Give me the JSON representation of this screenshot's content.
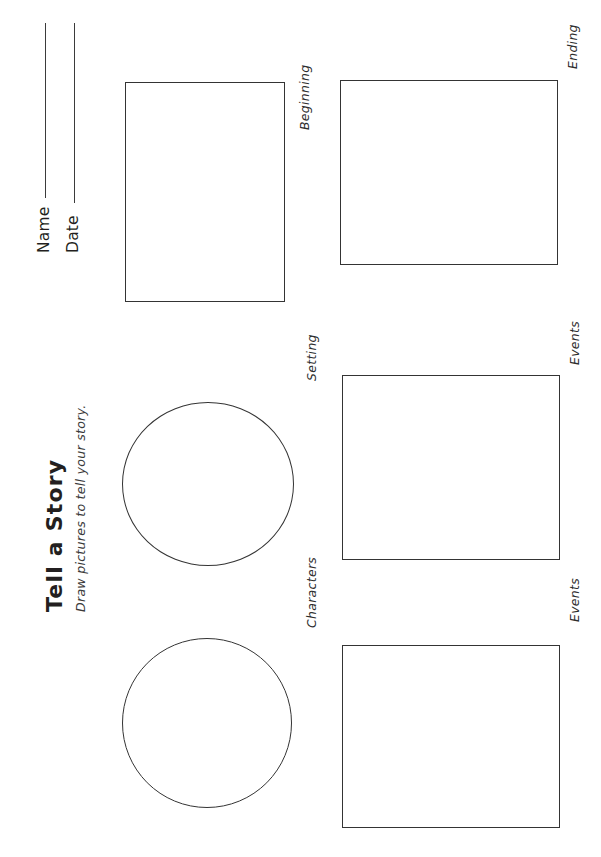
{
  "document": {
    "type": "printable-worksheet",
    "title": "Tell a Story",
    "subtitle": "Draw pictures to tell your story.",
    "orientation": "landscape-rotated-90ccw",
    "ink_color": "#343434",
    "paper_color": "#ffffff"
  },
  "header": {
    "name_label": "Name",
    "date_label": "Date",
    "name_value": "",
    "date_value": "",
    "name_placeholder": "",
    "date_placeholder": ""
  },
  "cells": [
    {
      "id": "characters",
      "label": "Characters",
      "shape": "circle",
      "content": ""
    },
    {
      "id": "setting",
      "label": "Setting",
      "shape": "circle",
      "content": ""
    },
    {
      "id": "beginning",
      "label": "Beginning",
      "shape": "rectangle",
      "content": ""
    },
    {
      "id": "events-1",
      "label": "Events",
      "shape": "rectangle",
      "content": ""
    },
    {
      "id": "events-2",
      "label": "Events",
      "shape": "rectangle",
      "content": ""
    },
    {
      "id": "ending",
      "label": "Ending",
      "shape": "rectangle",
      "content": ""
    }
  ]
}
